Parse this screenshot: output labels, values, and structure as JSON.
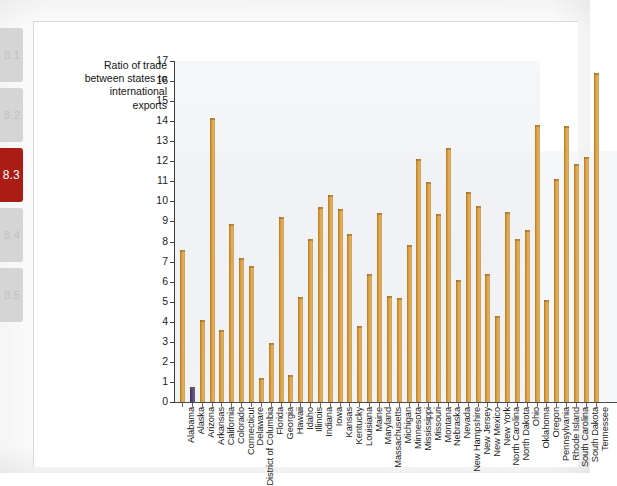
{
  "tab_rail": {
    "tabs": [
      {
        "label": "8.1",
        "active": false,
        "top": 28
      },
      {
        "label": "8.2",
        "active": false,
        "top": 88
      },
      {
        "label": "8.3",
        "active": true,
        "top": 148
      },
      {
        "label": "8.4",
        "active": false,
        "top": 208
      },
      {
        "label": "8.5",
        "active": false,
        "top": 268
      }
    ],
    "active_color": "#ab1c14",
    "inactive_color": "#d5d5d5"
  },
  "bleed_through": {
    "heading": "CONSEQUENCE",
    "subheading": "from Japan Plans no Own Rescue",
    "top_line": "the nuclear"
  },
  "chart_data": {
    "type": "bar",
    "title": "",
    "ylabel": "Ratio of trade between states to international exports",
    "xlabel": "",
    "ylim": [
      0,
      17
    ],
    "ytick_step": 1,
    "yticks": [
      0,
      1,
      2,
      3,
      4,
      5,
      6,
      7,
      8,
      9,
      10,
      11,
      12,
      13,
      14,
      15,
      16,
      17
    ],
    "grid": false,
    "legend": "none",
    "bar_color": "#d79a3a",
    "highlight_color": "#55487a",
    "highlight_category": "Alaska",
    "categories": [
      "Alabama",
      "Alaska",
      "Arizona",
      "Arkansas",
      "California",
      "Colorado",
      "Connecticut",
      "Delaware",
      "District of Columbia",
      "Florida",
      "Georgia",
      "Hawaii",
      "Idaho",
      "Illinois",
      "Indiana",
      "Iowa",
      "Kansas",
      "Kentucky",
      "Louisiana",
      "Maine",
      "Maryland",
      "Massachusetts",
      "Michigan",
      "Minnesota",
      "Mississippi",
      "Missouri",
      "Montana",
      "Nebraska",
      "Nevada",
      "New Hampshire",
      "New Jersey",
      "New Mexico",
      "New York",
      "North Carolina",
      "North Dakota",
      "Ohio",
      "Oklahoma",
      "Oregon",
      "Pennsylvania",
      "Rhode Island",
      "South Carolina",
      "South Dakota",
      "Tennessee"
    ],
    "values": [
      7.6,
      0.75,
      4.1,
      14.15,
      3.6,
      8.85,
      7.2,
      6.8,
      1.2,
      2.95,
      9.2,
      1.35,
      5.25,
      8.15,
      9.7,
      10.3,
      9.6,
      8.4,
      3.8,
      6.4,
      9.4,
      5.3,
      5.2,
      7.85,
      12.1,
      10.95,
      9.35,
      12.65,
      6.1,
      10.45,
      9.75,
      6.4,
      4.3,
      9.45,
      8.15,
      8.6,
      13.8,
      5.1,
      11.1,
      13.75,
      11.85,
      12.2,
      16.4
    ]
  }
}
